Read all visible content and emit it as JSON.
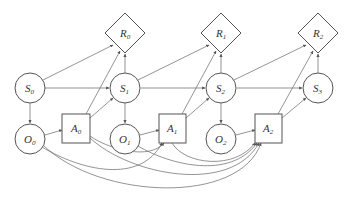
{
  "diagram": {
    "type": "influence-diagram",
    "colors": {
      "stroke": "#555555",
      "edge": "#666666",
      "text": "#333333",
      "background": "#ffffff"
    },
    "nodes": {
      "R0": {
        "base": "R",
        "sub": "0",
        "shape": "diamond"
      },
      "R1": {
        "base": "R",
        "sub": "1",
        "shape": "diamond"
      },
      "R2": {
        "base": "R",
        "sub": "2",
        "shape": "diamond"
      },
      "S0": {
        "base": "S",
        "sub": "0",
        "shape": "circle"
      },
      "S1": {
        "base": "S",
        "sub": "1",
        "shape": "circle"
      },
      "S2": {
        "base": "S",
        "sub": "2",
        "shape": "circle"
      },
      "S3": {
        "base": "S",
        "sub": "3",
        "shape": "circle"
      },
      "O0": {
        "base": "O",
        "sub": "0",
        "shape": "circle"
      },
      "O1": {
        "base": "O",
        "sub": "1",
        "shape": "circle"
      },
      "O2": {
        "base": "O",
        "sub": "2",
        "shape": "circle"
      },
      "A0": {
        "base": "A",
        "sub": "0",
        "shape": "square"
      },
      "A1": {
        "base": "A",
        "sub": "1",
        "shape": "square"
      },
      "A2": {
        "base": "A",
        "sub": "2",
        "shape": "square"
      }
    },
    "edges": [
      [
        "S0",
        "R0"
      ],
      [
        "S0",
        "S1"
      ],
      [
        "S0",
        "O0"
      ],
      [
        "S1",
        "R0"
      ],
      [
        "S1",
        "R1"
      ],
      [
        "S1",
        "S2"
      ],
      [
        "S1",
        "O1"
      ],
      [
        "S2",
        "R1"
      ],
      [
        "S2",
        "R2"
      ],
      [
        "S2",
        "S3"
      ],
      [
        "S2",
        "O2"
      ],
      [
        "S3",
        "R2"
      ],
      [
        "O0",
        "A0"
      ],
      [
        "O1",
        "A1"
      ],
      [
        "O2",
        "A2"
      ],
      [
        "A0",
        "R0"
      ],
      [
        "A0",
        "S1"
      ],
      [
        "A1",
        "R1"
      ],
      [
        "A1",
        "S2"
      ],
      [
        "A2",
        "R2"
      ],
      [
        "A2",
        "S3"
      ],
      [
        "O0",
        "A1"
      ],
      [
        "O0",
        "A2"
      ],
      [
        "A0",
        "A1"
      ],
      [
        "A0",
        "A2"
      ],
      [
        "O1",
        "A2"
      ],
      [
        "A1",
        "A2"
      ]
    ]
  }
}
